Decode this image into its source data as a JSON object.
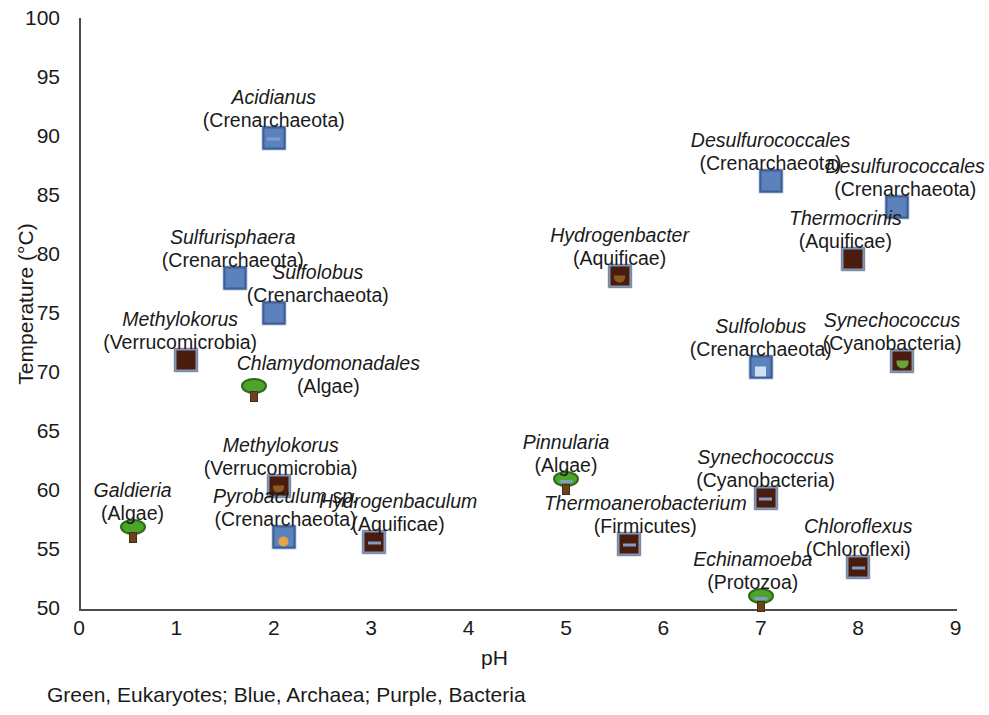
{
  "chart_data": {
    "type": "scatter",
    "title": "",
    "xlabel": "pH",
    "ylabel": "Temperature (°C)",
    "xlim": [
      0,
      9
    ],
    "ylim": [
      50,
      100
    ],
    "xticks": [
      "0",
      "1",
      "2",
      "3",
      "4",
      "5",
      "6",
      "7",
      "8",
      "9"
    ],
    "yticks": [
      "50",
      "55",
      "60",
      "65",
      "70",
      "75",
      "80",
      "85",
      "90",
      "95",
      "100"
    ],
    "grid": false,
    "legend_position": "below-plot",
    "legend_note": "Green, Eukaryotes; Blue, Archaea; Purple, Bacteria",
    "groups": [
      {
        "key": "eukaryote",
        "label": "Eukaryotes",
        "color": "#4ea32a",
        "color_name": "Green",
        "marker": "tree"
      },
      {
        "key": "archaea",
        "label": "Archaea",
        "color": "#5b82bc",
        "color_name": "Blue",
        "marker": "square"
      },
      {
        "key": "bacteria",
        "label": "Bacteria",
        "color": "#4a1c0d",
        "color_name": "Purple",
        "marker": "square"
      }
    ],
    "points": [
      {
        "genus": "Acidianus",
        "taxon": "(Crenarchaeota)",
        "x": 2.0,
        "y": 89.8,
        "group": "archaea",
        "stalk": "blue"
      },
      {
        "genus": "Sulfurisphaera",
        "taxon": "(Crenarchaeota)",
        "x": 1.6,
        "y": 78.0,
        "group": "archaea",
        "stalk": "none"
      },
      {
        "genus": "Sulfolobus",
        "taxon": "(Crenarchaeota)",
        "x": 2.0,
        "y": 75.0,
        "group": "archaea",
        "stalk": "none"
      },
      {
        "genus": "Methylokorus",
        "taxon": "(Verrucomicrobia)",
        "x": 1.1,
        "y": 71.0,
        "group": "bacteria",
        "stalk": "none"
      },
      {
        "genus": "Chlamydomonadales",
        "taxon": "(Algae)",
        "x": 1.8,
        "y": 68.5,
        "group": "eukaryote",
        "stalk": "none"
      },
      {
        "genus": "Methylokorus",
        "taxon": "(Verrucomicrobia)",
        "x": 2.05,
        "y": 60.3,
        "group": "bacteria",
        "stalk": "brown"
      },
      {
        "genus": "Galdieria",
        "taxon": "(Algae)",
        "x": 0.55,
        "y": 56.5,
        "group": "eukaryote",
        "stalk": "none"
      },
      {
        "genus": "Pyrobaculum sp.",
        "taxon": "(Crenarchaeota)",
        "x": 2.1,
        "y": 56.0,
        "group": "archaea",
        "stalk": "orange"
      },
      {
        "genus": "Hydrogenbaculum",
        "taxon": "(Aquificae)",
        "x": 3.03,
        "y": 55.6,
        "group": "bacteria",
        "stalk": "blue"
      },
      {
        "genus": "Pinnularia",
        "taxon": "(Algae)",
        "x": 5.0,
        "y": 60.6,
        "group": "eukaryote",
        "stalk": "blue"
      },
      {
        "genus": "Thermoanerobacterium",
        "taxon": "(Firmicutes)",
        "x": 5.65,
        "y": 55.4,
        "group": "bacteria",
        "stalk": "blue"
      },
      {
        "genus": "Hydrogenbacter",
        "taxon": "(Aquificae)",
        "x": 5.55,
        "y": 78.1,
        "group": "bacteria",
        "stalk": "brown"
      },
      {
        "genus": "Desulfurococcales",
        "taxon": "(Crenarchaeota)",
        "x": 7.1,
        "y": 86.2,
        "group": "archaea",
        "stalk": "none"
      },
      {
        "genus": "Desulfurococcales",
        "taxon": "(Crenarchaeota)",
        "x": 8.4,
        "y": 84.0,
        "group": "archaea",
        "stalk": "none"
      },
      {
        "genus": "Thermocrinis",
        "taxon": "(Aquificae)",
        "x": 7.95,
        "y": 79.6,
        "group": "bacteria",
        "stalk": "none"
      },
      {
        "genus": "Sulfolobus",
        "taxon": "(Crenarchaeota)",
        "x": 7.0,
        "y": 70.4,
        "group": "archaea",
        "stalk": "pale"
      },
      {
        "genus": "Synechococcus",
        "taxon": "(Cyanobacteria)",
        "x": 8.45,
        "y": 70.9,
        "group": "bacteria",
        "stalk": "green"
      },
      {
        "genus": "Synechococcus",
        "taxon": "(Cyanobacteria)",
        "x": 7.05,
        "y": 59.3,
        "group": "bacteria",
        "stalk": "blue"
      },
      {
        "genus": "Echinamoeba",
        "taxon": "(Protozoa)",
        "x": 7.0,
        "y": 50.7,
        "group": "eukaryote",
        "stalk": "blue"
      },
      {
        "genus": "Chloroflexus",
        "taxon": "(Chloroflexi)",
        "x": 8.0,
        "y": 53.5,
        "group": "bacteria",
        "stalk": "blue"
      }
    ],
    "label_offsets": [
      {
        "dx": 0,
        "dy": -52
      },
      {
        "dx": -2,
        "dy": -52
      },
      {
        "dx": 44,
        "dy": -52
      },
      {
        "dx": -6,
        "dy": -52
      },
      {
        "dx": 74,
        "dy": -38
      },
      {
        "dx": 2,
        "dy": -52
      },
      {
        "dx": 0,
        "dy": -52
      },
      {
        "dx": 2,
        "dy": -52
      },
      {
        "dx": 24,
        "dy": -52
      },
      {
        "dx": 0,
        "dy": -52
      },
      {
        "dx": 16,
        "dy": -52
      },
      {
        "dx": 0,
        "dy": -52
      },
      {
        "dx": 0,
        "dy": -52
      },
      {
        "dx": 8,
        "dy": -52
      },
      {
        "dx": -8,
        "dy": -52
      },
      {
        "dx": 0,
        "dy": -52
      },
      {
        "dx": -10,
        "dy": -52
      },
      {
        "dx": 0,
        "dy": -52
      },
      {
        "dx": -8,
        "dy": -52
      },
      {
        "dx": 0,
        "dy": -52
      }
    ]
  },
  "footer": {
    "note": "Green, Eukaryotes; Blue, Archaea; Purple, Bacteria"
  }
}
